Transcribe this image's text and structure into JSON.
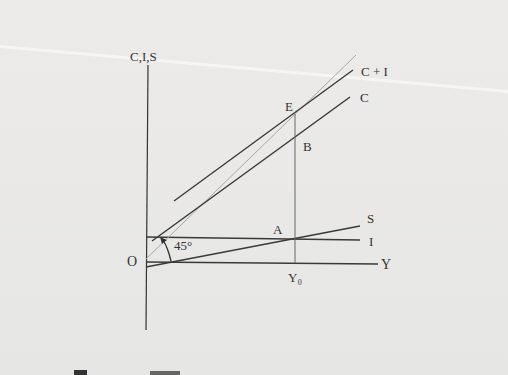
{
  "diagram": {
    "type": "keynesian-cross",
    "axes": {
      "y_label": "C,I,S",
      "x_label": "Y",
      "origin_label": "O"
    },
    "lines": [
      {
        "name": "C+I",
        "label": "C + I"
      },
      {
        "name": "C",
        "label": "C"
      },
      {
        "name": "S",
        "label": "S"
      },
      {
        "name": "I",
        "label": "I"
      },
      {
        "name": "45-degree",
        "label": "45°"
      }
    ],
    "points": {
      "E": "E",
      "B": "B",
      "A": "A"
    },
    "equilibrium_income": "Y₀",
    "angle_label": "45°",
    "colors": {
      "line": "#3a3a3a",
      "guide": "#9a9a9a",
      "background": "#e9e9e7"
    }
  }
}
